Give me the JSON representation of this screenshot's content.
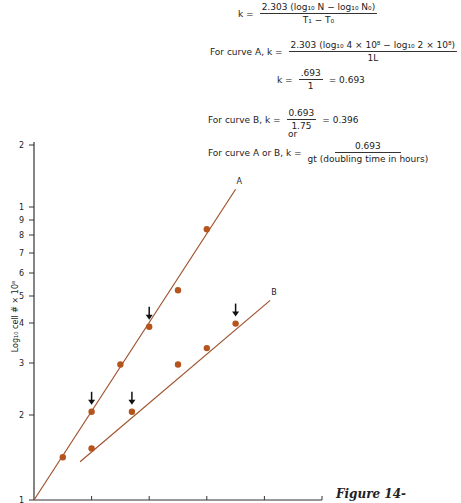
{
  "equations": {
    "general": {
      "lhs": "k =",
      "numerator": "2.303 (log₁₀ N − log₁₀ N₀)",
      "denominator": "T₁ − T₀"
    },
    "curve_a": {
      "prefix": "For curve A, k =",
      "numerator": "2.303 (log₁₀ 4 × 10⁸ − log₁₀ 2 × 10⁸)",
      "denominator": "1L"
    },
    "curve_a_result": {
      "lhs": "k =",
      "numerator": ".693",
      "denominator": "1",
      "result": "= 0.693"
    },
    "curve_b": {
      "prefix": "For curve B, k =",
      "numerator": "0.693",
      "denominator": "1.75",
      "result": "= 0.396"
    },
    "or_text": "or",
    "general_ab": {
      "prefix": "For curve A or B, k =",
      "numerator": "0.693",
      "denominator": "gt (doubling time in hours)"
    }
  },
  "figure_label": "Figure 14-",
  "colors": {
    "curve": "#a0522d",
    "point": "#b5541c",
    "axis": "#333333",
    "arrow": "#111111"
  },
  "chart_data": {
    "type": "scatter",
    "title": "",
    "xlabel": "",
    "ylabel": "Log₁₀ cell # × 10⁸",
    "yscale": "log",
    "ylim": [
      1,
      20
    ],
    "y_tick_labels": [
      "2",
      "1",
      "9",
      "8",
      "7",
      "6",
      "5",
      "4",
      "3",
      "2",
      "1"
    ],
    "x_ticks": [
      0,
      1,
      2,
      3,
      4,
      5
    ],
    "x_tick_labels": [
      "",
      "",
      "",
      "",
      "",
      ""
    ],
    "legend": [],
    "series": [
      {
        "name": "A",
        "x": [
          0.5,
          1.0,
          1.5,
          2.0,
          2.5,
          3.0
        ],
        "y": [
          1.4,
          2.0,
          2.9,
          3.9,
          5.2,
          8.4
        ],
        "fit_line": {
          "x": [
            0,
            3.5
          ],
          "y": [
            1.0,
            11.5
          ]
        },
        "arrows_at": [
          1.0,
          2.0
        ]
      },
      {
        "name": "B",
        "x": [
          1.0,
          1.7,
          2.5,
          3.0,
          3.5
        ],
        "y": [
          1.5,
          2.0,
          2.9,
          3.3,
          4.0
        ],
        "fit_line": {
          "x": [
            0.8,
            4.1
          ],
          "y": [
            1.35,
            4.8
          ]
        },
        "arrows_at": [
          1.7,
          3.5
        ]
      }
    ],
    "annotations": [
      "A",
      "B",
      "down arrows mark doubling interval points"
    ],
    "grid": false
  },
  "axis": {
    "y_ticks": [
      {
        "label": "2",
        "y": 145
      },
      {
        "label": "1",
        "y": 207
      },
      {
        "label": "9",
        "y": 220
      },
      {
        "label": "8",
        "y": 235
      },
      {
        "label": "7",
        "y": 253
      },
      {
        "label": "6",
        "y": 273
      },
      {
        "label": "5",
        "y": 296
      },
      {
        "label": "4",
        "y": 323
      },
      {
        "label": "3",
        "y": 363
      },
      {
        "label": "2",
        "y": 415
      },
      {
        "label": "1",
        "y": 500
      }
    ],
    "ylabel": "Log₁₀ cell # × 10⁸"
  },
  "curve_labels": {
    "a": "A",
    "b": "B"
  }
}
